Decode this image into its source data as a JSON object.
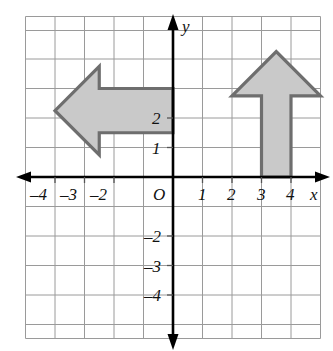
{
  "figure": {
    "background": "#ffffff"
  },
  "colors": {
    "grid_line": "#9a9a9a",
    "axis_line": "#000000",
    "shape_fill": "#c9c9c9",
    "shape_stroke": "#6e6e6e",
    "text": "#111111"
  },
  "axes": {
    "x_axis_label": "x",
    "y_axis_label": "y",
    "origin_label": "O",
    "x_range": [
      -5,
      5
    ],
    "y_range": [
      -5,
      3.75
    ],
    "grid": true,
    "grid_step": 1,
    "x_ticks": [
      {
        "value": -4,
        "label": "–4"
      },
      {
        "value": -3,
        "label": "–3"
      },
      {
        "value": -2,
        "label": "–2"
      },
      {
        "value": 1,
        "label": "1"
      },
      {
        "value": 2,
        "label": "2"
      },
      {
        "value": 3,
        "label": "3"
      },
      {
        "value": 4,
        "label": "4"
      }
    ],
    "y_ticks": [
      {
        "value": 2,
        "label": "2"
      },
      {
        "value": 1,
        "label": "1"
      },
      {
        "value": -2,
        "label": "–2"
      },
      {
        "value": -3,
        "label": "–3"
      },
      {
        "value": -4,
        "label": "–4"
      }
    ]
  },
  "shapes": [
    {
      "name": "left-arrow",
      "direction": "left",
      "fill": "#c9c9c9",
      "stroke": "#6e6e6e",
      "vertices": [
        [
          0,
          3
        ],
        [
          -2.5,
          3
        ],
        [
          -2.5,
          3.75
        ],
        [
          -4,
          2.25
        ],
        [
          -2.5,
          0.75
        ],
        [
          -2.5,
          1.5
        ],
        [
          0,
          1.5
        ]
      ]
    },
    {
      "name": "up-arrow",
      "direction": "up",
      "fill": "#c9c9c9",
      "stroke": "#6e6e6e",
      "vertices": [
        [
          3,
          0
        ],
        [
          3,
          2.75
        ],
        [
          2,
          2.75
        ],
        [
          3.5,
          3.75
        ],
        [
          5,
          2.75
        ],
        [
          4,
          2.75
        ],
        [
          4,
          0
        ]
      ]
    }
  ]
}
